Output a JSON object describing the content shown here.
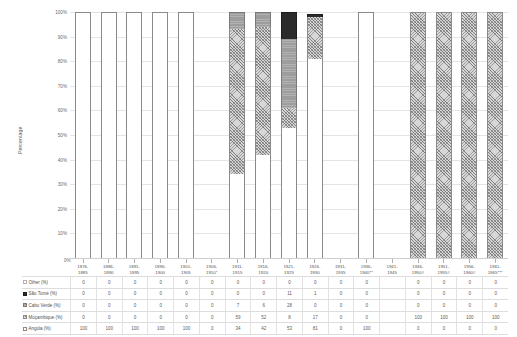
{
  "chart_data": {
    "type": "bar",
    "stacked": true,
    "title": "",
    "xlabel": "",
    "ylabel": "Percentage",
    "ylim": [
      0,
      100
    ],
    "ytick_labels": [
      "0%",
      "10%",
      "20%",
      "30%",
      "40%",
      "50%",
      "60%",
      "70%",
      "80%",
      "90%",
      "100%"
    ],
    "ytick_values": [
      0,
      10,
      20,
      30,
      40,
      50,
      60,
      70,
      80,
      90,
      100
    ],
    "grid": true,
    "legend_position": "table-left",
    "categories": [
      "1876-1885",
      "1886-1890",
      "1891-1895",
      "1896-1900",
      "1901-1905",
      "1906-1910*",
      "1911-1915",
      "1916-1920",
      "1921-1925",
      "1926-1930",
      "1931-1935",
      "1936-1940**",
      "1941-1945",
      "1946-1950#",
      "1951-1955#",
      "1956-1960#",
      "1961-1965***"
    ],
    "categories_line1": [
      "1876-",
      "1886-",
      "1891-",
      "1896-",
      "1901-",
      "1906-",
      "1911-",
      "1916-",
      "1921-",
      "1926-",
      "1931-",
      "1936-",
      "1941-",
      "1946-",
      "1951-",
      "1956-",
      "1961-"
    ],
    "categories_line2": [
      "1885",
      "1890",
      "1895",
      "1900",
      "1905",
      "1910*",
      "1915",
      "1920",
      "1925",
      "1930",
      "1935",
      "1940**",
      "1945",
      "1950#",
      "1955#",
      "1960#",
      "1965***"
    ],
    "series": [
      {
        "name": "Angola (%)",
        "key": "angola",
        "values": [
          100,
          100,
          100,
          100,
          100,
          0,
          34,
          42,
          53,
          81,
          0,
          100,
          0,
          0,
          0,
          0,
          0
        ]
      },
      {
        "name": "Moçambique (%)",
        "key": "mocambique",
        "values": [
          0,
          0,
          0,
          0,
          0,
          0,
          59,
          52,
          8,
          17,
          0,
          0,
          0,
          100,
          100,
          100,
          100
        ]
      },
      {
        "name": "Cabo Verde (%)",
        "key": "caboverde",
        "values": [
          0,
          0,
          0,
          0,
          0,
          0,
          7,
          6,
          28,
          0,
          0,
          0,
          0,
          0,
          0,
          0,
          0
        ]
      },
      {
        "name": "São Tomé (%)",
        "key": "saotome",
        "values": [
          0,
          0,
          0,
          0,
          0,
          0,
          0,
          0,
          11,
          1,
          0,
          0,
          0,
          0,
          0,
          0,
          0
        ]
      },
      {
        "name": "Other (%)",
        "key": "other",
        "values": [
          0,
          0,
          0,
          0,
          0,
          0,
          0,
          0,
          0,
          0,
          0,
          0,
          0,
          0,
          0,
          0,
          0
        ]
      }
    ]
  },
  "axis": {
    "y_title": "Percentage",
    "zero_label": "0%"
  },
  "table": {
    "row_labels": [
      "Other (%)",
      "São Tomé (%)",
      "Cabo Verde (%)",
      "Moçambique (%)",
      "Angola (%)"
    ]
  }
}
